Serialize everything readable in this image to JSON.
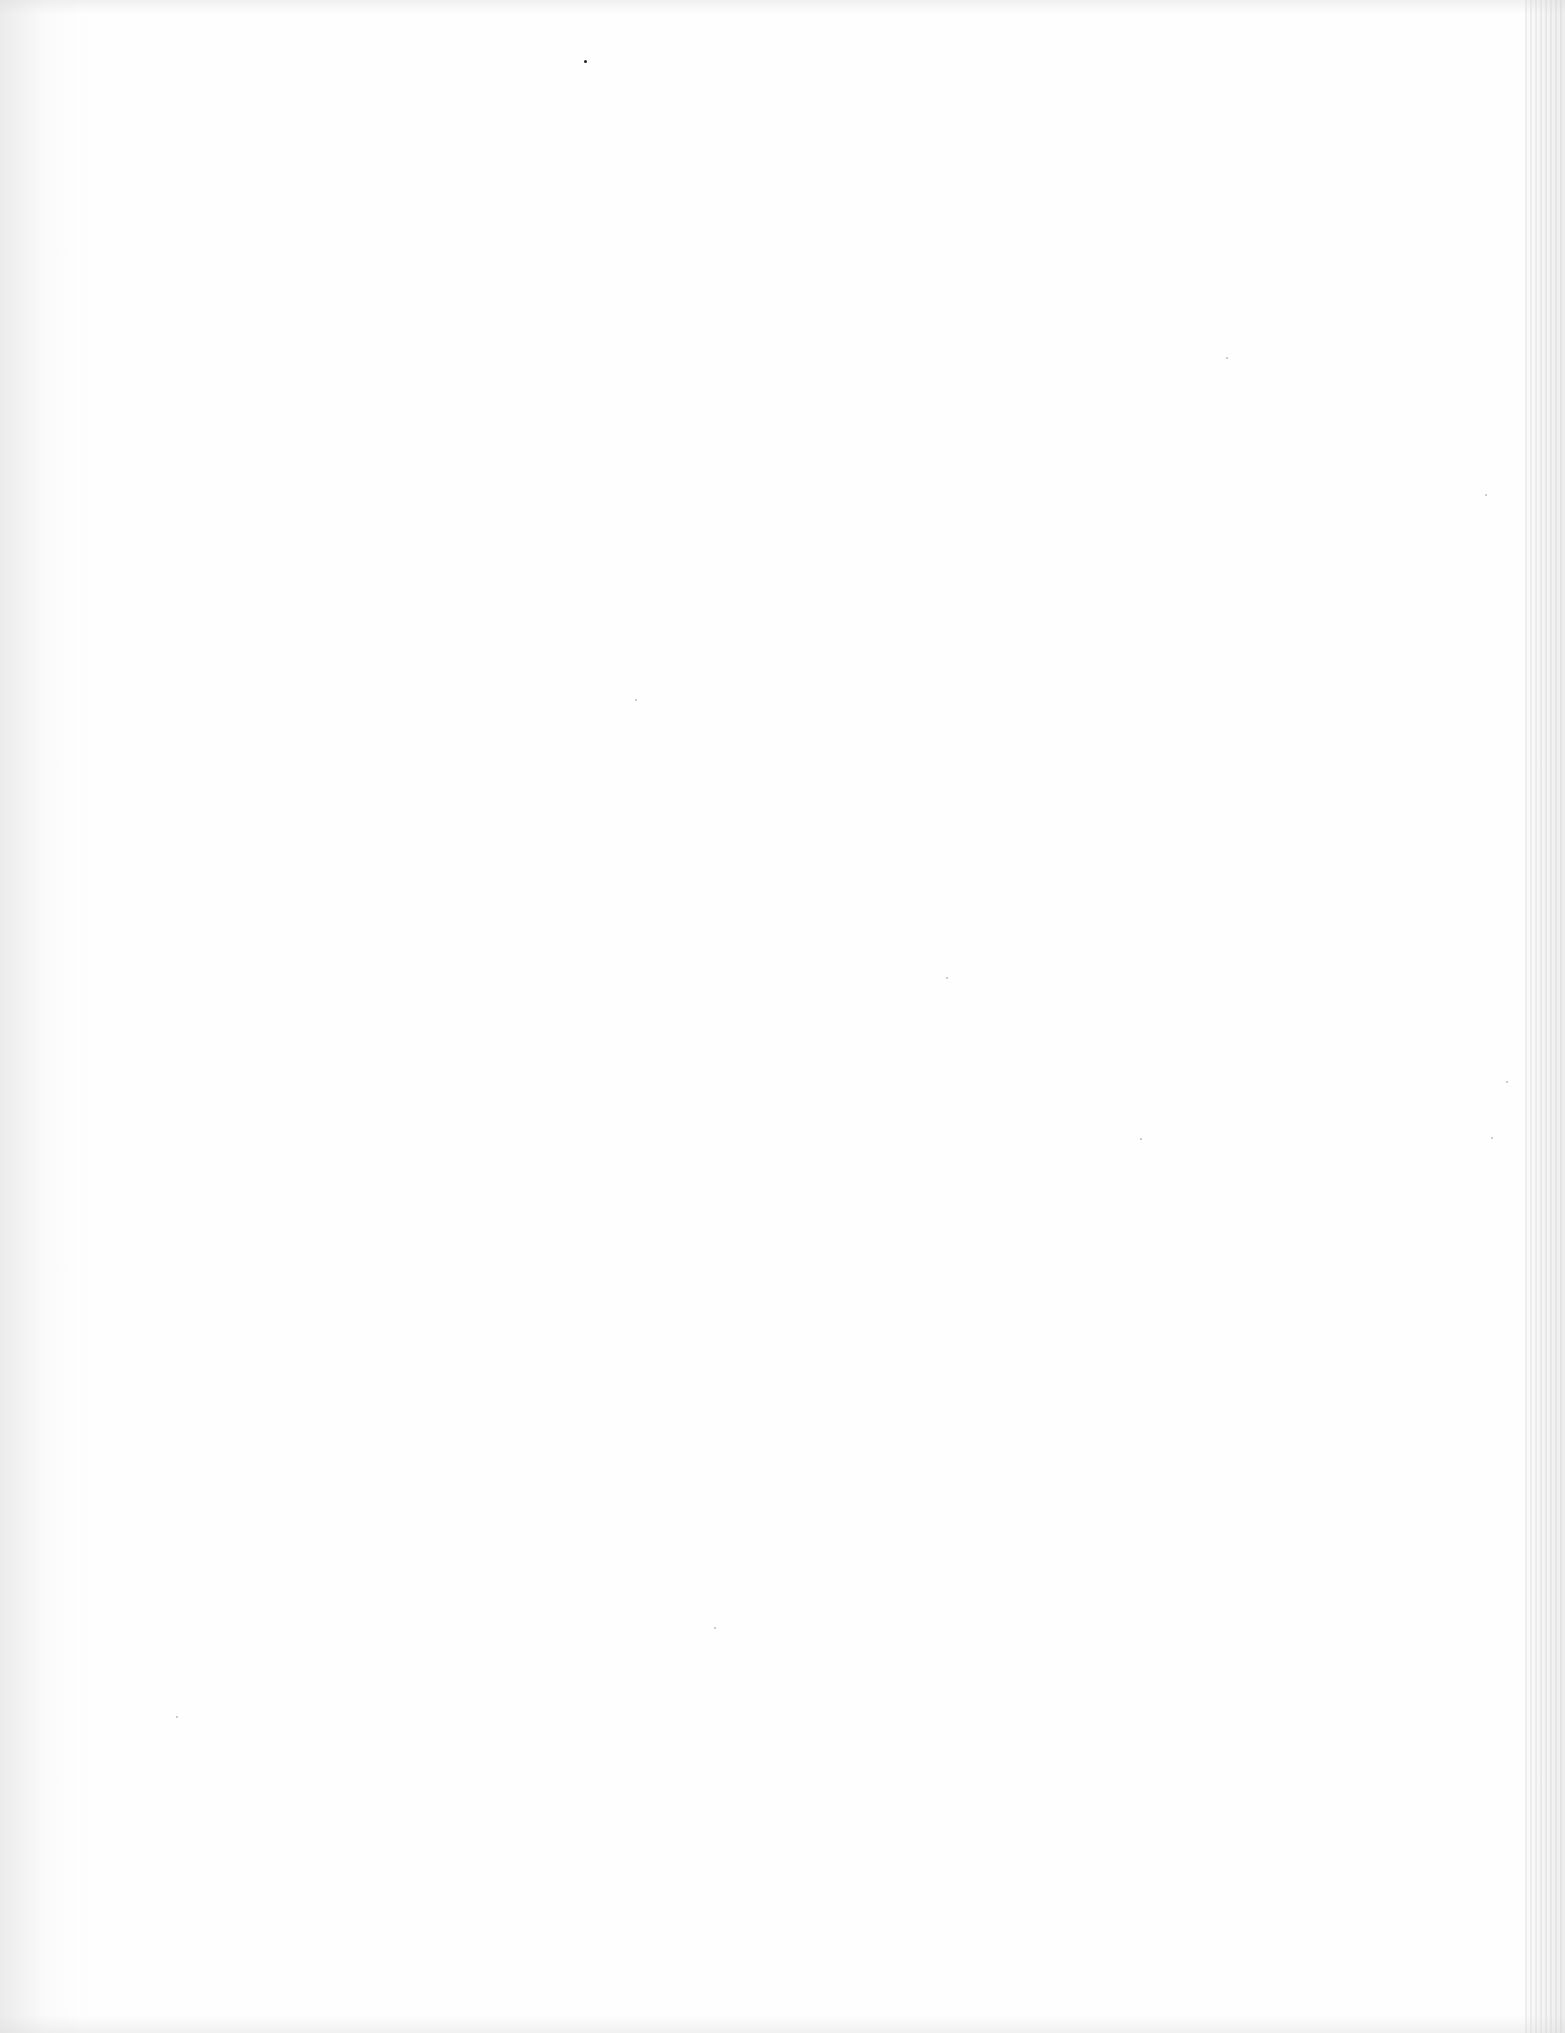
{
  "document": {
    "type": "blank-scanned-page",
    "text_content": ""
  }
}
